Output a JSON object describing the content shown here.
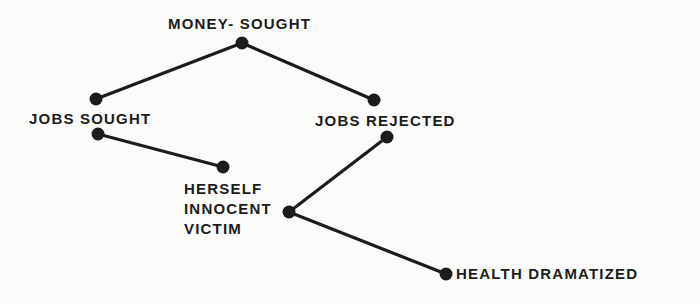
{
  "diagram": {
    "colors": {
      "ink": "#1c1c1c",
      "background": "#fbfbfa"
    },
    "nodes": {
      "money_sought": {
        "label": "MONEY- SOUGHT"
      },
      "jobs_sought": {
        "label": "JOBS SOUGHT"
      },
      "jobs_rejected": {
        "label": "JOBS REJECTED"
      },
      "herself_innocent_victim": {
        "lines": [
          "HERSELF",
          "INNOCENT",
          "VICTIM"
        ]
      },
      "health_dramatized": {
        "label": "HEALTH DRAMATIZED"
      }
    },
    "edges": [
      {
        "from": "money_sought",
        "to": "jobs_sought"
      },
      {
        "from": "money_sought",
        "to": "jobs_rejected"
      },
      {
        "from": "jobs_sought",
        "to": "herself_innocent_victim"
      },
      {
        "from": "jobs_rejected",
        "to": "herself_innocent_victim"
      },
      {
        "from": "herself_innocent_victim",
        "to": "health_dramatized"
      }
    ]
  }
}
